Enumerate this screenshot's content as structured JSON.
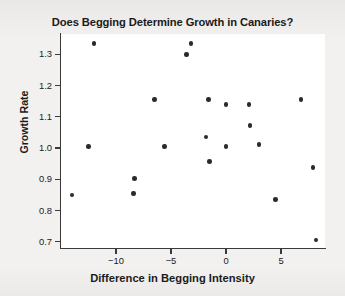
{
  "chart_data": {
    "type": "scatter",
    "title": "Does Begging Determine Growth in Canaries?",
    "xlabel": "Difference in Begging Intensity",
    "ylabel": "Growth Rate",
    "xlim": [
      -15.0,
      9.0
    ],
    "ylim": [
      0.68,
      1.365
    ],
    "grid": false,
    "legend": null,
    "xticks": [
      -10,
      -5,
      0,
      5
    ],
    "xtick_labels": [
      "−10",
      "−5",
      "0",
      "5"
    ],
    "yticks": [
      0.7,
      0.8,
      0.9,
      1.0,
      1.1,
      1.2,
      1.3
    ],
    "ytick_labels": [
      "0.7",
      "0.8",
      "0.9",
      "1.0",
      "1.1",
      "1.2",
      "1.3"
    ],
    "marker": "filled-circle",
    "marker_color": "#2a2a2a",
    "points": [
      {
        "x": -14.0,
        "y": 0.85
      },
      {
        "x": -12.5,
        "y": 1.005
      },
      {
        "x": -12.0,
        "y": 1.335
      },
      {
        "x": -8.4,
        "y": 0.855
      },
      {
        "x": -8.3,
        "y": 0.903
      },
      {
        "x": -6.5,
        "y": 1.155
      },
      {
        "x": -5.6,
        "y": 1.005
      },
      {
        "x": -3.6,
        "y": 1.3
      },
      {
        "x": -3.2,
        "y": 1.335
      },
      {
        "x": -1.8,
        "y": 1.035
      },
      {
        "x": -1.6,
        "y": 1.155
      },
      {
        "x": -1.5,
        "y": 0.957
      },
      {
        "x": 0.0,
        "y": 1.14
      },
      {
        "x": 0.0,
        "y": 1.005
      },
      {
        "x": 2.1,
        "y": 1.14
      },
      {
        "x": 2.2,
        "y": 1.072
      },
      {
        "x": 3.0,
        "y": 1.012
      },
      {
        "x": 4.5,
        "y": 0.836
      },
      {
        "x": 6.8,
        "y": 1.155
      },
      {
        "x": 7.9,
        "y": 0.937
      },
      {
        "x": 8.2,
        "y": 0.705
      }
    ]
  },
  "colors": {
    "background": "#f2f1ef",
    "plot_background": "#ffffff",
    "axis": "#3a3a3a",
    "text": "#1b1b1b",
    "marker": "#2a2a2a"
  }
}
